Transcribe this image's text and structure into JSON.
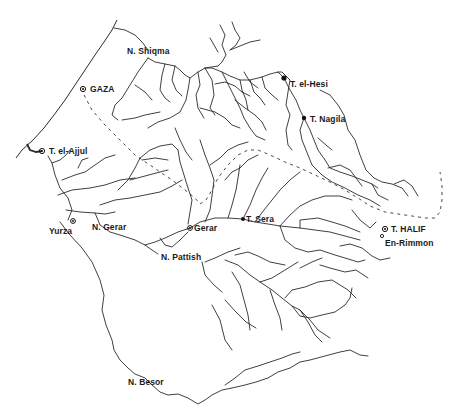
{
  "map": {
    "type": "hydrological-sketch-map",
    "colors": {
      "lines": "#2a2a2a",
      "background": "#ffffff",
      "labels": "#1a1a1a"
    }
  },
  "sites": [
    {
      "id": "gaza",
      "label": "GAZA",
      "symbol": "circled-dot",
      "x": 83,
      "y": 89
    },
    {
      "id": "t-el-ajjul",
      "label": "T. el-Ajjul",
      "symbol": "circled-dot",
      "x": 42,
      "y": 151
    },
    {
      "id": "yurza",
      "label": "Yurza",
      "symbol": "circled-dot",
      "x": 73,
      "y": 222
    },
    {
      "id": "gerar",
      "label": "Gerar",
      "symbol": "circled-dot",
      "x": 190,
      "y": 228
    },
    {
      "id": "t-sera",
      "label": "T. Sera",
      "symbol": "filled-dot",
      "x": 243,
      "y": 219
    },
    {
      "id": "t-el-hesi",
      "label": "T. el-Hesi",
      "symbol": "filled-dot",
      "x": 284,
      "y": 78
    },
    {
      "id": "t-nagila",
      "label": "T. Nagila",
      "symbol": "filled-dot",
      "x": 304,
      "y": 118
    },
    {
      "id": "t-halif",
      "label": "T. HALIF",
      "symbol": "circled-dot",
      "x": 385,
      "y": 229
    },
    {
      "id": "en-rimmon",
      "label": "En-Rimmon",
      "symbol": "small-circle",
      "x": 382,
      "y": 236
    }
  ],
  "wadis": [
    {
      "id": "n-shiqma",
      "label": "N. Shiqma"
    },
    {
      "id": "n-gerar",
      "label": "N. Gerar"
    },
    {
      "id": "n-pattish",
      "label": "N. Pattish"
    },
    {
      "id": "n-besor",
      "label": "N. Besor"
    }
  ],
  "caption": {
    "visible_fragment": ""
  }
}
